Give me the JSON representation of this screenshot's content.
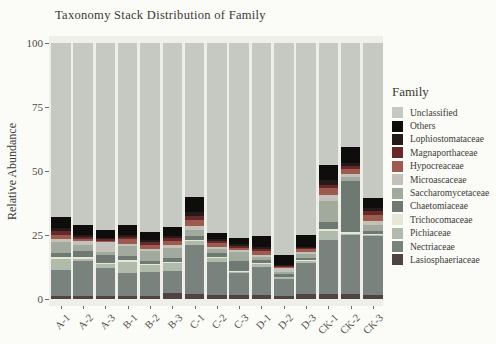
{
  "page": {
    "background": "#fbfbf8",
    "panel_background": "#efefea",
    "text_color": "#3a3a36"
  },
  "chart_data": {
    "type": "bar",
    "stacked": true,
    "title": "Taxonomy Stack Distribution of Family",
    "xlabel": "",
    "ylabel": "Relative Abundance",
    "ylim": [
      0,
      100
    ],
    "yticks": [
      0,
      25,
      50,
      75,
      100
    ],
    "grid": false,
    "legend_title": "Family",
    "legend_position": "right",
    "categories": [
      "A-1",
      "A-2",
      "A-3",
      "B-1",
      "B-2",
      "B-3",
      "C-1",
      "C-2",
      "C-3",
      "D-1",
      "D-2",
      "D-3",
      "CK-1",
      "CK-2",
      "CK-3"
    ],
    "stacking_note": "bars stack bottom-to-top in reverse of series order; series listed top-to-bottom as in legend",
    "series": [
      {
        "name": "Unclassified",
        "color": "#c6c9c2",
        "values": [
          68.0,
          71.0,
          73.0,
          71.0,
          73.7,
          72.0,
          60.0,
          74.0,
          76.0,
          75.5,
          82.7,
          75.0,
          47.5,
          40.5,
          60.5
        ]
      },
      {
        "name": "Others",
        "color": "#0e0d0b",
        "values": [
          4.4,
          4.0,
          3.0,
          3.8,
          3.3,
          3.5,
          6.0,
          2.5,
          2.5,
          4.0,
          4.0,
          4.5,
          6.0,
          6.2,
          4.0
        ]
      },
      {
        "name": "Lophiostomataceae",
        "color": "#241a19",
        "values": [
          1.0,
          0.7,
          0.7,
          0.8,
          0.8,
          0.8,
          1.5,
          0.7,
          0.6,
          0.9,
          0.4,
          0.4,
          1.8,
          1.3,
          1.0
        ]
      },
      {
        "name": "Magnaporthaceae",
        "color": "#67282a",
        "values": [
          1.4,
          0.8,
          0.6,
          1.1,
          1.1,
          1.0,
          1.5,
          0.8,
          0.8,
          0.9,
          0.4,
          0.5,
          1.5,
          1.0,
          1.5
        ]
      },
      {
        "name": "Hypocreaceae",
        "color": "#9d5a4e",
        "values": [
          1.8,
          1.0,
          0.6,
          1.6,
          1.6,
          1.6,
          2.5,
          1.5,
          1.0,
          1.3,
          0.5,
          1.2,
          2.5,
          2.0,
          2.5
        ]
      },
      {
        "name": "Microascaceae",
        "color": "#c4c1ba",
        "values": [
          1.0,
          1.2,
          3.6,
          1.0,
          0.8,
          1.0,
          1.5,
          1.0,
          0.7,
          0.8,
          1.4,
          0.7,
          2.5,
          1.5,
          1.5
        ]
      },
      {
        "name": "Saccharomycetaceae",
        "color": "#a2aa9e",
        "values": [
          4.6,
          2.4,
          1.2,
          4.0,
          4.0,
          4.0,
          2.5,
          1.5,
          3.5,
          1.5,
          0.8,
          1.5,
          8.0,
          1.5,
          2.5
        ]
      },
      {
        "name": "Chaetomiaceae",
        "color": "#6e7a71",
        "values": [
          1.4,
          2.6,
          3.2,
          1.6,
          1.0,
          1.6,
          1.5,
          1.5,
          4.0,
          1.2,
          1.0,
          1.0,
          3.0,
          20.0,
          1.0
        ]
      },
      {
        "name": "Trichocomaceae",
        "color": "#e7e7d9",
        "values": [
          0.6,
          0.5,
          0.5,
          0.5,
          0.4,
          0.5,
          0.5,
          0.5,
          0.4,
          0.4,
          0.3,
          0.4,
          0.7,
          0.5,
          0.5
        ]
      },
      {
        "name": "Pichiaceae",
        "color": "#b1bbab",
        "values": [
          4.6,
          0.8,
          1.6,
          4.4,
          2.8,
          3.0,
          1.5,
          1.5,
          0.5,
          1.0,
          0.8,
          0.8,
          3.5,
          0.5,
          0.5
        ]
      },
      {
        "name": "Nectriaceae",
        "color": "#79827c",
        "values": [
          10.0,
          14.0,
          11.0,
          9.0,
          9.5,
          8.8,
          19.0,
          13.0,
          8.5,
          11.0,
          6.5,
          12.0,
          21.0,
          23.0,
          23.0
        ]
      },
      {
        "name": "Lasiosphaeriaceae",
        "color": "#4f4243",
        "values": [
          1.2,
          1.0,
          1.0,
          1.2,
          1.0,
          2.2,
          2.0,
          1.5,
          1.5,
          1.5,
          1.2,
          2.0,
          2.0,
          2.0,
          1.5
        ]
      }
    ]
  }
}
